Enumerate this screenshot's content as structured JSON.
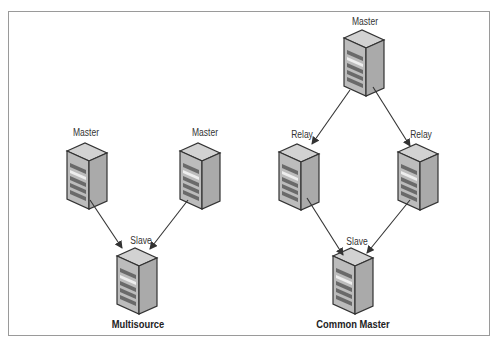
{
  "diagrams": {
    "multisource": {
      "caption": "Multisource",
      "nodes": [
        {
          "id": "master1",
          "label": "Master"
        },
        {
          "id": "master2",
          "label": "Master"
        },
        {
          "id": "slave",
          "label": "Slave"
        }
      ],
      "edges": [
        {
          "from": "master1",
          "to": "slave"
        },
        {
          "from": "master2",
          "to": "slave"
        }
      ]
    },
    "common_master": {
      "caption": "Common Master",
      "nodes": [
        {
          "id": "master",
          "label": "Master"
        },
        {
          "id": "relay1",
          "label": "Relay"
        },
        {
          "id": "relay2",
          "label": "Relay"
        },
        {
          "id": "slave",
          "label": "Slave"
        }
      ],
      "edges": [
        {
          "from": "master",
          "to": "relay1"
        },
        {
          "from": "master",
          "to": "relay2"
        },
        {
          "from": "relay1",
          "to": "slave"
        },
        {
          "from": "relay2",
          "to": "slave"
        }
      ]
    }
  },
  "colors": {
    "frame": "#9a9a9a",
    "server_front": "#b9b9b9",
    "server_side": "#a9a9a9",
    "server_top": "#cfcfcf",
    "outline": "#333333",
    "arrow": "#333333"
  }
}
